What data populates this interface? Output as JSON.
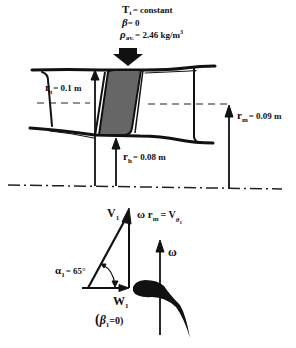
{
  "conditions": {
    "tt_symbol": "T",
    "tt_sub": "t",
    "tt_value": "= constant",
    "beta_symbol": "β",
    "beta_value": "= 0",
    "rho_symbol": "ρ",
    "rho_sub": "av.",
    "rho_value": "= 2.46  kg/m",
    "rho_exp": "3"
  },
  "radii": {
    "rt_symbol": "r",
    "rt_sub": "t",
    "rt_value": "= 0.1  m",
    "rm_symbol": "r",
    "rm_sub": "m",
    "rm_value": "= 0.09  m",
    "rh_symbol": "r",
    "rh_sub": "h",
    "rh_value": "= 0.08  m"
  },
  "velocity_triangle": {
    "v1_symbol": "V",
    "v1_sub": "1",
    "blade_speed_lhs": "ω r",
    "blade_speed_sub": "m",
    "blade_speed_eq": "= V",
    "blade_speed_rhs_sub": "θ",
    "blade_speed_rhs_subsub": "1",
    "alpha_symbol": "α",
    "alpha_sub": "1",
    "alpha_value": "= 65°",
    "w1_symbol": "W",
    "w1_sub": "1",
    "beta1_open": "(",
    "beta1_symbol": "β",
    "beta1_sub": "1",
    "beta1_value": "=0)",
    "omega_symbol": "ω"
  },
  "colors": {
    "stroke": "#111111",
    "blade_fill": "#666666",
    "background": "#ffffff"
  }
}
